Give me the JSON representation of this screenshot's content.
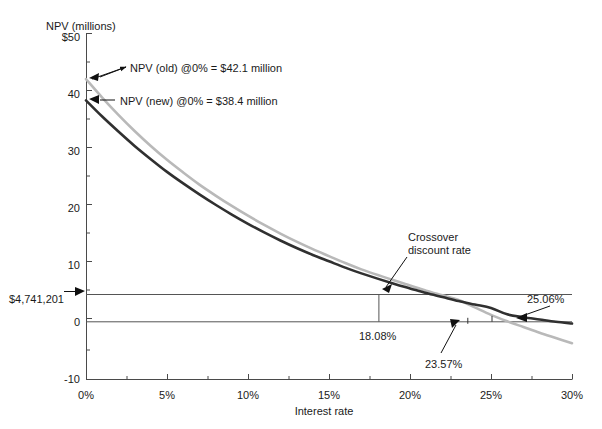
{
  "chart_data": {
    "type": "line",
    "title": "",
    "ylabel": "NPV (millions)",
    "xlabel": "Interest rate",
    "xlim": [
      0,
      30
    ],
    "ylim": [
      -10,
      50
    ],
    "grid": false,
    "legend_position": "none",
    "x_ticks": [
      "0%",
      "5%",
      "10%",
      "15%",
      "20%",
      "25%",
      "30%"
    ],
    "x_tick_values": [
      0,
      5,
      10,
      15,
      20,
      25,
      30
    ],
    "y_ticks": [
      "$50",
      "40",
      "30",
      "20",
      "10",
      "0",
      "-10"
    ],
    "y_tick_values": [
      50,
      40,
      30,
      20,
      10,
      0,
      -10
    ],
    "y_minor_ticks": [
      45,
      35,
      25,
      15,
      5,
      -5
    ],
    "x_minor_ticks": [
      2.5,
      7.5,
      12.5,
      17.5,
      22.5,
      27.5
    ],
    "series": [
      {
        "name": "NPV (old)",
        "color": "#b9b9b9",
        "x": [
          0,
          1,
          2,
          3,
          4,
          5,
          6,
          7,
          8,
          9,
          10,
          11,
          12,
          13,
          14,
          15,
          16,
          17,
          18.08,
          19,
          20,
          21,
          22,
          23,
          23.57,
          24,
          25,
          26,
          27,
          28,
          29,
          30
        ],
        "values": [
          42.1,
          38.9,
          35.9,
          33.1,
          30.5,
          28.1,
          25.9,
          23.8,
          21.9,
          20.1,
          18.4,
          16.8,
          15.3,
          13.9,
          12.6,
          11.4,
          10.2,
          9.1,
          4.74,
          7.2,
          6.3,
          5.4,
          4.6,
          3.8,
          0.0,
          2.5,
          1.2,
          0.1,
          -0.9,
          -1.9,
          -2.8,
          -3.7
        ]
      },
      {
        "name": "NPV (new)",
        "color": "#303030",
        "x": [
          0,
          1,
          2,
          3,
          4,
          5,
          6,
          7,
          8,
          9,
          10,
          11,
          12,
          13,
          14,
          15,
          16,
          17,
          18.08,
          19,
          20,
          21,
          22,
          23,
          24,
          25,
          25.06,
          26,
          27,
          28,
          29,
          30
        ],
        "values": [
          38.4,
          35.6,
          33.0,
          30.5,
          28.2,
          26.0,
          24.0,
          22.1,
          20.3,
          18.6,
          17.0,
          15.5,
          14.1,
          12.8,
          11.6,
          10.5,
          9.4,
          8.4,
          4.74,
          6.6,
          5.8,
          5.0,
          4.3,
          3.6,
          3.0,
          2.4,
          0.0,
          1.3,
          0.8,
          0.4,
          0.0,
          -0.3
        ]
      }
    ],
    "reference_lines": [
      {
        "name": "crossover-npv-line",
        "orientation": "horizontal",
        "y": 4.741201,
        "label": "$4,741,201"
      },
      {
        "name": "zero-line",
        "orientation": "horizontal",
        "y": 0,
        "label": "0"
      },
      {
        "name": "crossover-rate-line",
        "orientation": "vertical",
        "x": 18.08,
        "y_from": 0,
        "y_to": 4.741201,
        "label": "18.08%"
      }
    ],
    "annotations": [
      {
        "name": "npv-old-callout",
        "text": "NPV (old) @0% = $42.1 million",
        "target_x": 0,
        "target_y": 42.1
      },
      {
        "name": "npv-new-callout",
        "text": "NPV (new) @0% = $38.4 million",
        "target_x": 0,
        "target_y": 38.4
      },
      {
        "name": "crossover-callout",
        "text_line1": "Crossover",
        "text_line2": "discount rate",
        "target_x": 18.08,
        "target_y": 4.741201
      },
      {
        "name": "irr-new-callout",
        "text": "25.06%",
        "target_x": 25.06,
        "target_y": 0
      },
      {
        "name": "irr-old-callout",
        "text": "23.57%",
        "target_x": 23.57,
        "target_y": 0
      }
    ],
    "axis_value_labels": {
      "crossover_npv": "$4,741,201",
      "crossover_rate": "18.08%",
      "irr_old": "23.57%",
      "irr_new": "25.06%"
    }
  },
  "axis": {
    "y_title": "NPV (millions)",
    "x_title": "Interest rate"
  },
  "colors": {
    "series_old": "#b9b9b9",
    "series_new": "#303030",
    "axis": "#444444",
    "text": "#1a1a1a",
    "reference_line": "#555555"
  }
}
